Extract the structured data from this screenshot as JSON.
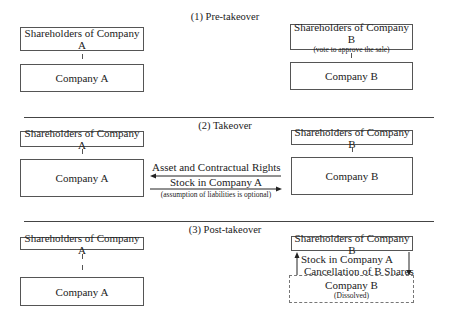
{
  "sections": [
    {
      "title": "(1) Pre-takeover",
      "left": {
        "shareholders": "Shareholders of Company A",
        "company": "Company A"
      },
      "right": {
        "shareholders": "Shareholders of Company B",
        "shareholders_note": "(vote to approve the sale)",
        "company": "Company B"
      }
    },
    {
      "title": "(2) Takeover",
      "left": {
        "shareholders": "Shareholders of Company A",
        "company": "Company A"
      },
      "right": {
        "shareholders": "Shareholders of Company B",
        "company": "Company B"
      },
      "flows": {
        "to_a": "Asset and Contractual Rights",
        "to_b": "Stock in Company A",
        "note": "(assumption of liabilities is optional)"
      }
    },
    {
      "title": "(3) Post-takeover",
      "left": {
        "shareholders": "Shareholders of Company A",
        "company": "Company A"
      },
      "right": {
        "shareholders": "Shareholders of Company B",
        "company": "Company B",
        "company_note": "(Dissolved)"
      },
      "flows": {
        "up": "Stock in Company A",
        "down": "Cancellation of B Shares"
      }
    }
  ]
}
